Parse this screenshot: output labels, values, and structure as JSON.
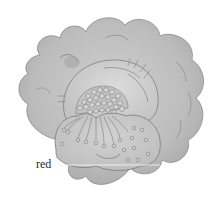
{
  "figure": {
    "style": "grayscale watercolor sketch",
    "colors": {
      "background": "#ffffff",
      "outer_petals": "#bdbdbd",
      "outer_petals_shadow": "#a8a8a8",
      "inner_petal": "#cfcfcf",
      "front_petal": "#c6c6c6",
      "outline": "#7a7a7a",
      "leader_line": "#f2f2f2"
    }
  },
  "labels": [
    {
      "text": "red",
      "x": 36,
      "y": 158
    }
  ],
  "leader_line": {
    "x1": 53,
    "y1": 165,
    "x2": 160,
    "y2": 165
  }
}
